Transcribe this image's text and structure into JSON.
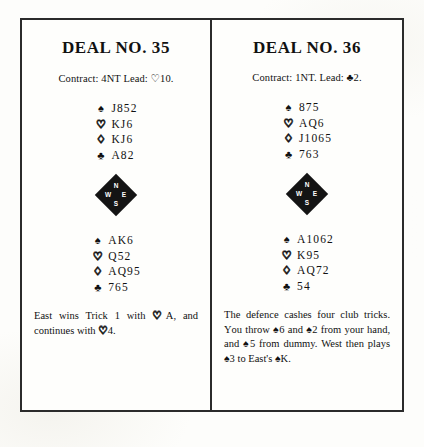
{
  "page": {
    "background_color": "#fdfdfb",
    "ink_color": "#111111",
    "border_color": "#2b2b2b"
  },
  "compass": {
    "north_label": "N",
    "west_label": "W",
    "east_label": "E",
    "south_label": "S"
  },
  "suit_glyphs": {
    "spade": "♠",
    "heart": "♡",
    "diamond": "♢",
    "club": "♣"
  },
  "deals": [
    {
      "title": "DEAL NO. 35",
      "contract_line": "Contract: 4NT Lead: ♡10.",
      "north_hand": [
        {
          "suit": "spade",
          "glyph": "♠",
          "style": "black",
          "cards": "J852"
        },
        {
          "suit": "heart",
          "glyph": "♡",
          "style": "outline",
          "cards": "KJ6"
        },
        {
          "suit": "diamond",
          "glyph": "♢",
          "style": "outline",
          "cards": "KJ6"
        },
        {
          "suit": "club",
          "glyph": "♣",
          "style": "black",
          "cards": "A82"
        }
      ],
      "south_hand": [
        {
          "suit": "spade",
          "glyph": "♠",
          "style": "black",
          "cards": "AK6"
        },
        {
          "suit": "heart",
          "glyph": "♡",
          "style": "outline",
          "cards": "Q52"
        },
        {
          "suit": "diamond",
          "glyph": "♢",
          "style": "outline",
          "cards": "AQ95"
        },
        {
          "suit": "club",
          "glyph": "♣",
          "style": "black",
          "cards": "765"
        }
      ],
      "note": "East wins Trick 1 with ♡A, and continues with ♡4."
    },
    {
      "title": "DEAL NO. 36",
      "contract_line": "Contract: 1NT. Lead: ♣2.",
      "north_hand": [
        {
          "suit": "spade",
          "glyph": "♠",
          "style": "black",
          "cards": "875"
        },
        {
          "suit": "heart",
          "glyph": "♡",
          "style": "outline",
          "cards": "AQ6"
        },
        {
          "suit": "diamond",
          "glyph": "♢",
          "style": "outline",
          "cards": "J1065"
        },
        {
          "suit": "club",
          "glyph": "♣",
          "style": "black",
          "cards": "763"
        }
      ],
      "south_hand": [
        {
          "suit": "spade",
          "glyph": "♠",
          "style": "black",
          "cards": "A1062"
        },
        {
          "suit": "heart",
          "glyph": "♡",
          "style": "outline",
          "cards": "K95"
        },
        {
          "suit": "diamond",
          "glyph": "♢",
          "style": "outline",
          "cards": "AQ72"
        },
        {
          "suit": "club",
          "glyph": "♣",
          "style": "black",
          "cards": "54"
        }
      ],
      "note": "The defence cashes four club tricks. You throw ♠6 and ♠2 from your hand, and ♠5 from dummy. West then plays ♠3 to East's ♠K."
    }
  ]
}
